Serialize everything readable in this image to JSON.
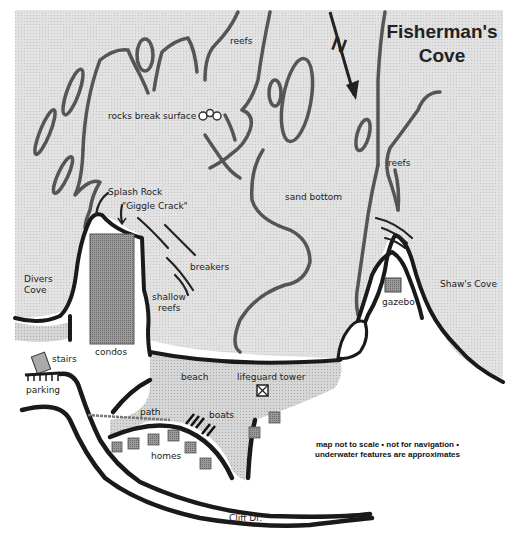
{
  "map": {
    "title_line1": "Fisherman's",
    "title_line2": "Cove",
    "north_label": "N",
    "disclaimer_line1": "map not to scale • not for navigation •",
    "disclaimer_line2": "underwater features are approximates",
    "colors": {
      "water": "#dcdcdc",
      "sand": "#cfcfcf",
      "land": "#ffffff",
      "outline": "#1a1a1a",
      "reef_outline": "#555555",
      "building": "#8a8a8a"
    },
    "labels": {
      "reefs_top": "reefs",
      "rocks_break_surface": "rocks break surface",
      "reefs_right": "reefs",
      "sand_bottom": "sand bottom",
      "splash_rock": "Splash Rock",
      "giggle_crack": "\"Giggle Crack\"",
      "breakers": "breakers",
      "shallow_line1": "shallow",
      "shallow_line2": "reefs",
      "divers_line1": "Divers",
      "divers_line2": "Cove",
      "shaws_cove": "Shaw's Cove",
      "gazebo": "gazebo",
      "condos": "condos",
      "stairs": "stairs",
      "parking": "parking",
      "beach": "beach",
      "lifeguard_tower": "lifeguard tower",
      "path": "path",
      "boats": "boats",
      "homes": "homes",
      "cliff_dr": "Cliff Dr."
    }
  }
}
